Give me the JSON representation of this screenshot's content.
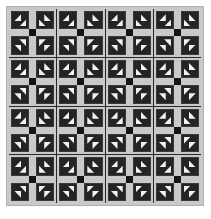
{
  "artwork": {
    "title": "Patchwork quilt",
    "kind": "quilt-pattern",
    "grid_rows": 4,
    "grid_cols": 4,
    "block_name": "sashed four-patch with flying geese",
    "quadrants_per_block": 4,
    "geese_per_quadrant": 2
  },
  "colors": {
    "background": "#ffffff",
    "border_light": "#c9c9c9",
    "border_outline": "#b0b0b0",
    "grid_line": "#2a2a2a",
    "patch_dark": "#242424",
    "patch_dark_edge": "#3a3a3a",
    "sashing": "#c9c9c9",
    "center_square": "#141414",
    "geese_light": "#f2f2f2"
  },
  "canvas": {
    "width": 211,
    "height": 219
  },
  "blocks": [
    {
      "row": 1,
      "col": 1
    },
    {
      "row": 1,
      "col": 2
    },
    {
      "row": 1,
      "col": 3
    },
    {
      "row": 1,
      "col": 4
    },
    {
      "row": 2,
      "col": 1
    },
    {
      "row": 2,
      "col": 2
    },
    {
      "row": 2,
      "col": 3
    },
    {
      "row": 2,
      "col": 4
    },
    {
      "row": 3,
      "col": 1
    },
    {
      "row": 3,
      "col": 2
    },
    {
      "row": 3,
      "col": 3
    },
    {
      "row": 3,
      "col": 4
    },
    {
      "row": 4,
      "col": 1
    },
    {
      "row": 4,
      "col": 2
    },
    {
      "row": 4,
      "col": 3
    },
    {
      "row": 4,
      "col": 4
    }
  ],
  "quadrant_order": [
    "top-left",
    "top-right",
    "bottom-left",
    "bottom-right"
  ]
}
